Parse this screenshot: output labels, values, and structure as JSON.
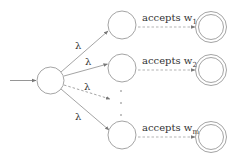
{
  "diagram": {
    "type": "nfa",
    "colors": {
      "stroke": "#9a9a9a",
      "text": "#333333",
      "background": "#ffffff"
    },
    "start_state": {
      "cx": 50.5,
      "cy": 80.5,
      "r": 13.5
    },
    "epsilon_label": "λ",
    "branches": [
      {
        "id": "1",
        "cx": 122,
        "cy": 25,
        "label": "accepts w",
        "subscript": "1",
        "edge_style": "solid",
        "accept": {
          "cx": 211,
          "cy": 27
        }
      },
      {
        "id": "2",
        "cx": 122,
        "cy": 68,
        "label": "accepts w",
        "subscript": "2",
        "edge_style": "solid",
        "accept": {
          "cx": 211,
          "cy": 70
        }
      },
      {
        "id": "m",
        "cx": 122,
        "cy": 135,
        "label": "accepts w",
        "subscript": "m",
        "edge_style": "solid",
        "accept": {
          "cx": 211,
          "cy": 137
        }
      }
    ],
    "ellipsis_edge": {
      "label": "λ",
      "style": "dashed"
    },
    "vertical_dots": "⋮"
  }
}
